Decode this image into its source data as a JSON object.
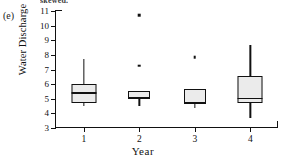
{
  "figure": {
    "panel_label": "(e)",
    "cropped_caption_line": "skewed.",
    "xlabel": "Year",
    "ylabel": "Water Discharge"
  },
  "axes": {
    "y_ticks": [
      "3",
      "4",
      "5",
      "6",
      "7",
      "8",
      "9",
      "10",
      "11"
    ],
    "x_ticks": [
      "1",
      "2",
      "3",
      "4"
    ]
  },
  "colors": {
    "box_fill": "#ebebeb",
    "line": "#111111",
    "background": "#ffffff"
  },
  "chart_data": {
    "type": "boxplot",
    "title": "",
    "xlabel": "Year",
    "ylabel": "Water Discharge",
    "xlim": [
      0.5,
      4.5
    ],
    "ylim": [
      3,
      11
    ],
    "y_ticks": [
      3,
      4,
      5,
      6,
      7,
      8,
      9,
      10,
      11
    ],
    "grid": false,
    "legend": "none",
    "categories": [
      "1",
      "2",
      "3",
      "4"
    ],
    "boxes": [
      {
        "category": "1",
        "whisker_low": 4.5,
        "q1": 4.7,
        "median": 5.45,
        "q3": 6.0,
        "whisker_high": 7.7,
        "outliers": []
      },
      {
        "category": "2",
        "whisker_low": 4.5,
        "q1": 4.95,
        "median": 5.15,
        "q3": 5.5,
        "whisker_high": 5.5,
        "outliers": [
          7.25,
          10.7
        ]
      },
      {
        "category": "3",
        "whisker_low": 4.4,
        "q1": 4.65,
        "median": 4.8,
        "q3": 5.65,
        "whisker_high": 5.7,
        "outliers": [
          7.85
        ]
      },
      {
        "category": "4",
        "whisker_low": 3.7,
        "q1": 4.7,
        "median": 5.05,
        "q3": 6.55,
        "whisker_high": 8.65,
        "outliers": []
      }
    ]
  }
}
